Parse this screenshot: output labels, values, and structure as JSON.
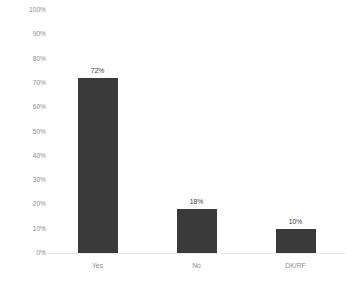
{
  "chart_data": {
    "type": "bar",
    "title": "",
    "subtitle": "",
    "xlabel": "",
    "ylabel": "",
    "categories": [
      "Yes",
      "No",
      "DK/RF"
    ],
    "values": [
      72,
      18,
      10
    ],
    "value_labels": [
      "72%",
      "18%",
      "10%"
    ],
    "ylim": [
      0,
      100
    ],
    "y_ticks": [
      0,
      10,
      20,
      30,
      40,
      50,
      60,
      70,
      80,
      90,
      100
    ],
    "y_tick_labels": [
      "0%",
      "10%",
      "20%",
      "30%",
      "40%",
      "50%",
      "60%",
      "70%",
      "80%",
      "90%",
      "100%"
    ],
    "grid": false,
    "legend": false,
    "legend_position": "none",
    "series": [
      {
        "name": "",
        "values": [
          72,
          18,
          10
        ]
      }
    ]
  },
  "style": {
    "background_color": "#ffffff",
    "bar_color": "#3a3a3a",
    "axis_line_color": "#e8e8e8",
    "tick_label_color": "#8c8c8c",
    "value_label_color": "#404040"
  }
}
